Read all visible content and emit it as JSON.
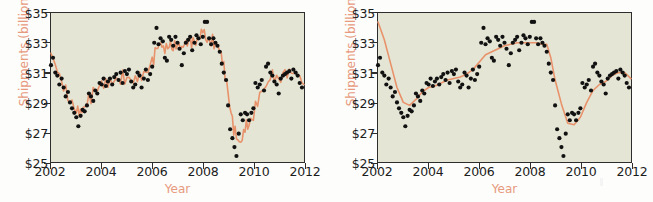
{
  "figure": {
    "background": "#fdfdfb",
    "plot_background": "#e4e5d4",
    "accent_color": "#e79a7e",
    "line_color": "#e8926b",
    "point_color": "#111111",
    "axis_color": "#2d2d2d"
  },
  "panels": [
    {
      "id": "left",
      "ylabel": "Shipments (billion, SA)",
      "xlabel": "Year",
      "yticks": [
        "$25",
        "$27",
        "$29",
        "$31",
        "$33",
        "$35"
      ],
      "xticks": [
        "2002",
        "2004",
        "2006",
        "2008",
        "2010",
        "2012"
      ]
    },
    {
      "id": "right",
      "ylabel": "Shipments (billion, SA)",
      "xlabel": "Year",
      "yticks": [
        "$25",
        "$27",
        "$29",
        "$31",
        "$33",
        "$35"
      ],
      "xticks": [
        "2002",
        "2004",
        "2006",
        "2008",
        "2010",
        "2012"
      ]
    }
  ],
  "chart_data": [
    {
      "type": "scatter",
      "panel": "left",
      "title": "",
      "xlabel": "Year",
      "ylabel": "Shipments (billion, SA)",
      "xlim": [
        2002,
        2012
      ],
      "ylim": [
        25,
        35
      ],
      "xticks": [
        2002,
        2004,
        2006,
        2008,
        2010,
        2012
      ],
      "yticks": [
        25,
        27,
        29,
        31,
        33,
        35
      ],
      "ytick_labels": [
        "$25",
        "$27",
        "$29",
        "$31",
        "$33",
        "$35"
      ],
      "grid": false,
      "legend": "none",
      "series": [
        {
          "name": "Observed shipments",
          "type": "scatter",
          "marker": "filled-circle",
          "color": "#111111",
          "x": [
            2002.0,
            2002.08,
            2002.17,
            2002.25,
            2002.33,
            2002.42,
            2002.5,
            2002.58,
            2002.67,
            2002.75,
            2002.83,
            2002.92,
            2003.0,
            2003.08,
            2003.17,
            2003.25,
            2003.33,
            2003.42,
            2003.5,
            2003.58,
            2003.67,
            2003.75,
            2003.83,
            2003.92,
            2004.0,
            2004.08,
            2004.17,
            2004.25,
            2004.33,
            2004.42,
            2004.5,
            2004.58,
            2004.67,
            2004.75,
            2004.83,
            2004.92,
            2005.0,
            2005.08,
            2005.17,
            2005.25,
            2005.33,
            2005.42,
            2005.5,
            2005.58,
            2005.67,
            2005.75,
            2005.83,
            2005.92,
            2006.0,
            2006.08,
            2006.17,
            2006.25,
            2006.33,
            2006.42,
            2006.5,
            2006.58,
            2006.67,
            2006.75,
            2006.83,
            2006.92,
            2007.0,
            2007.08,
            2007.17,
            2007.25,
            2007.33,
            2007.42,
            2007.5,
            2007.58,
            2007.67,
            2007.75,
            2007.83,
            2007.92,
            2008.0,
            2008.08,
            2008.17,
            2008.25,
            2008.33,
            2008.42,
            2008.5,
            2008.58,
            2008.67,
            2008.75,
            2008.83,
            2008.92,
            2009.0,
            2009.08,
            2009.17,
            2009.25,
            2009.33,
            2009.42,
            2009.5,
            2009.58,
            2009.67,
            2009.75,
            2009.83,
            2009.92,
            2010.0,
            2010.08,
            2010.17,
            2010.25,
            2010.33,
            2010.42,
            2010.5,
            2010.58,
            2010.67,
            2010.75,
            2010.83,
            2010.92,
            2011.0,
            2011.08,
            2011.17,
            2011.25,
            2011.33,
            2011.42,
            2011.5,
            2011.58,
            2011.67,
            2011.75,
            2011.83,
            2011.92
          ],
          "y": [
            31.5,
            32.0,
            31.0,
            30.8,
            30.2,
            30.6,
            30.0,
            29.4,
            29.7,
            29.0,
            28.6,
            28.3,
            28.0,
            27.4,
            28.1,
            28.5,
            28.4,
            28.8,
            29.6,
            29.4,
            29.1,
            29.8,
            29.6,
            30.3,
            30.2,
            30.6,
            30.1,
            30.4,
            30.6,
            30.2,
            30.7,
            30.9,
            30.5,
            31.0,
            30.3,
            31.1,
            30.9,
            31.2,
            30.4,
            30.0,
            30.2,
            31.0,
            30.8,
            30.0,
            30.6,
            31.2,
            30.5,
            30.9,
            31.4,
            33.0,
            34.0,
            32.9,
            33.3,
            33.1,
            32.0,
            31.8,
            33.4,
            33.2,
            32.8,
            33.4,
            33.0,
            32.6,
            31.5,
            32.3,
            33.0,
            33.2,
            33.4,
            32.5,
            33.0,
            33.5,
            33.3,
            32.9,
            33.4,
            34.4,
            34.4,
            33.3,
            32.9,
            33.3,
            33.0,
            32.8,
            32.4,
            31.6,
            31.0,
            30.5,
            28.8,
            27.2,
            26.6,
            26.0,
            25.4,
            26.9,
            28.2,
            27.8,
            28.3,
            28.2,
            27.8,
            28.3,
            28.6,
            30.3,
            30.0,
            30.2,
            30.5,
            29.8,
            31.4,
            31.6,
            31.0,
            30.8,
            30.4,
            30.2,
            29.6,
            30.6,
            30.8,
            30.9,
            31.0,
            31.1,
            30.6,
            31.2,
            31.0,
            30.8,
            30.3,
            30.0
          ]
        },
        {
          "name": "Trend (unsmoothed / jagged fit)",
          "type": "line",
          "color": "#e8926b",
          "smoothing": "low",
          "x": [
            2002.0,
            2002.25,
            2002.5,
            2002.75,
            2003.0,
            2003.17,
            2003.33,
            2003.5,
            2003.75,
            2004.0,
            2004.25,
            2004.5,
            2004.75,
            2005.0,
            2005.25,
            2005.5,
            2005.75,
            2006.0,
            2006.17,
            2006.33,
            2006.5,
            2006.67,
            2006.83,
            2007.0,
            2007.17,
            2007.33,
            2007.5,
            2007.67,
            2007.83,
            2008.0,
            2008.17,
            2008.33,
            2008.5,
            2008.67,
            2008.83,
            2009.0,
            2009.17,
            2009.33,
            2009.5,
            2009.67,
            2009.83,
            2010.0,
            2010.25,
            2010.5,
            2010.75,
            2011.0,
            2011.25,
            2011.5,
            2011.75,
            2012.0
          ],
          "y": [
            32.3,
            31.2,
            30.1,
            29.2,
            28.5,
            28.4,
            28.6,
            29.2,
            29.7,
            30.2,
            30.3,
            30.5,
            30.7,
            30.7,
            30.5,
            30.7,
            30.9,
            31.6,
            32.6,
            32.9,
            32.6,
            32.9,
            32.8,
            32.9,
            32.7,
            32.9,
            33.1,
            32.9,
            33.2,
            33.9,
            33.2,
            33.2,
            33.0,
            32.6,
            31.4,
            29.5,
            27.6,
            26.6,
            26.2,
            27.4,
            27.6,
            28.2,
            29.6,
            30.1,
            30.8,
            30.4,
            30.9,
            31.0,
            30.9,
            30.2
          ]
        }
      ]
    },
    {
      "type": "scatter",
      "panel": "right",
      "title": "",
      "xlabel": "Year",
      "ylabel": "Shipments (billion, SA)",
      "xlim": [
        2002,
        2012
      ],
      "ylim": [
        25,
        35
      ],
      "xticks": [
        2002,
        2004,
        2006,
        2008,
        2010,
        2012
      ],
      "yticks": [
        25,
        27,
        29,
        31,
        33,
        35
      ],
      "ytick_labels": [
        "$25",
        "$27",
        "$29",
        "$31",
        "$33",
        "$35"
      ],
      "grid": false,
      "legend": "none",
      "series": [
        {
          "name": "Observed shipments",
          "type": "scatter",
          "marker": "filled-circle",
          "color": "#111111",
          "x": [
            2002.0,
            2002.08,
            2002.17,
            2002.25,
            2002.33,
            2002.42,
            2002.5,
            2002.58,
            2002.67,
            2002.75,
            2002.83,
            2002.92,
            2003.0,
            2003.08,
            2003.17,
            2003.25,
            2003.33,
            2003.42,
            2003.5,
            2003.58,
            2003.67,
            2003.75,
            2003.83,
            2003.92,
            2004.0,
            2004.08,
            2004.17,
            2004.25,
            2004.33,
            2004.42,
            2004.5,
            2004.58,
            2004.67,
            2004.75,
            2004.83,
            2004.92,
            2005.0,
            2005.08,
            2005.17,
            2005.25,
            2005.33,
            2005.42,
            2005.5,
            2005.58,
            2005.67,
            2005.75,
            2005.83,
            2005.92,
            2006.0,
            2006.08,
            2006.17,
            2006.25,
            2006.33,
            2006.42,
            2006.5,
            2006.58,
            2006.67,
            2006.75,
            2006.83,
            2006.92,
            2007.0,
            2007.08,
            2007.17,
            2007.25,
            2007.33,
            2007.42,
            2007.5,
            2007.58,
            2007.67,
            2007.75,
            2007.83,
            2007.92,
            2008.0,
            2008.08,
            2008.17,
            2008.25,
            2008.33,
            2008.42,
            2008.5,
            2008.58,
            2008.67,
            2008.75,
            2008.83,
            2008.92,
            2009.0,
            2009.08,
            2009.17,
            2009.25,
            2009.33,
            2009.42,
            2009.5,
            2009.58,
            2009.67,
            2009.75,
            2009.83,
            2009.92,
            2010.0,
            2010.08,
            2010.17,
            2010.25,
            2010.33,
            2010.42,
            2010.5,
            2010.58,
            2010.67,
            2010.75,
            2010.83,
            2010.92,
            2011.0,
            2011.08,
            2011.17,
            2011.25,
            2011.33,
            2011.42,
            2011.5,
            2011.58,
            2011.67,
            2011.75,
            2011.83,
            2011.92
          ],
          "y": [
            31.5,
            32.0,
            31.0,
            30.8,
            30.2,
            30.6,
            30.0,
            29.4,
            29.7,
            29.0,
            28.6,
            28.3,
            28.0,
            27.4,
            28.1,
            28.5,
            28.4,
            28.8,
            29.6,
            29.4,
            29.1,
            29.8,
            29.6,
            30.3,
            30.2,
            30.6,
            30.1,
            30.4,
            30.6,
            30.2,
            30.7,
            30.9,
            30.5,
            31.0,
            30.3,
            31.1,
            30.9,
            31.2,
            30.4,
            30.0,
            30.2,
            31.0,
            30.8,
            30.0,
            30.6,
            31.2,
            30.5,
            30.9,
            31.4,
            33.0,
            34.0,
            32.9,
            33.3,
            33.1,
            32.0,
            31.8,
            33.4,
            33.2,
            32.8,
            33.4,
            33.0,
            32.6,
            31.5,
            32.3,
            33.0,
            33.2,
            33.4,
            32.5,
            33.0,
            33.5,
            33.3,
            32.9,
            33.4,
            34.4,
            34.4,
            33.3,
            32.9,
            33.3,
            33.0,
            32.8,
            32.4,
            31.6,
            31.0,
            30.5,
            28.8,
            27.2,
            26.6,
            26.0,
            25.4,
            26.9,
            28.2,
            27.8,
            28.3,
            28.2,
            27.8,
            28.3,
            28.6,
            30.3,
            30.0,
            30.2,
            30.5,
            29.8,
            31.4,
            31.6,
            31.0,
            30.8,
            30.4,
            30.2,
            29.6,
            30.6,
            30.8,
            30.9,
            31.0,
            31.1,
            30.6,
            31.2,
            31.0,
            30.8,
            30.3,
            30.0
          ]
        },
        {
          "name": "Trend (smoothed fit)",
          "type": "line",
          "color": "#e8926b",
          "smoothing": "high",
          "x": [
            2002.0,
            2002.25,
            2002.5,
            2002.75,
            2003.0,
            2003.25,
            2003.5,
            2003.75,
            2004.0,
            2004.25,
            2004.5,
            2004.75,
            2005.0,
            2005.25,
            2005.5,
            2005.75,
            2006.0,
            2006.25,
            2006.5,
            2006.75,
            2007.0,
            2007.25,
            2007.5,
            2007.75,
            2008.0,
            2008.25,
            2008.5,
            2008.67,
            2008.83,
            2009.0,
            2009.25,
            2009.5,
            2009.75,
            2010.0,
            2010.25,
            2010.5,
            2010.75,
            2011.0,
            2011.25,
            2011.5,
            2011.75,
            2012.0
          ],
          "y": [
            34.4,
            33.2,
            31.6,
            30.0,
            29.0,
            28.8,
            29.2,
            29.7,
            30.0,
            30.1,
            30.3,
            30.5,
            30.6,
            30.7,
            30.9,
            31.2,
            31.7,
            32.2,
            32.4,
            32.6,
            32.8,
            32.9,
            33.0,
            33.0,
            33.0,
            33.0,
            32.9,
            32.9,
            32.0,
            30.5,
            28.9,
            27.6,
            27.5,
            28.0,
            29.0,
            29.8,
            30.2,
            30.4,
            30.8,
            31.0,
            31.0,
            30.6
          ]
        }
      ]
    }
  ]
}
